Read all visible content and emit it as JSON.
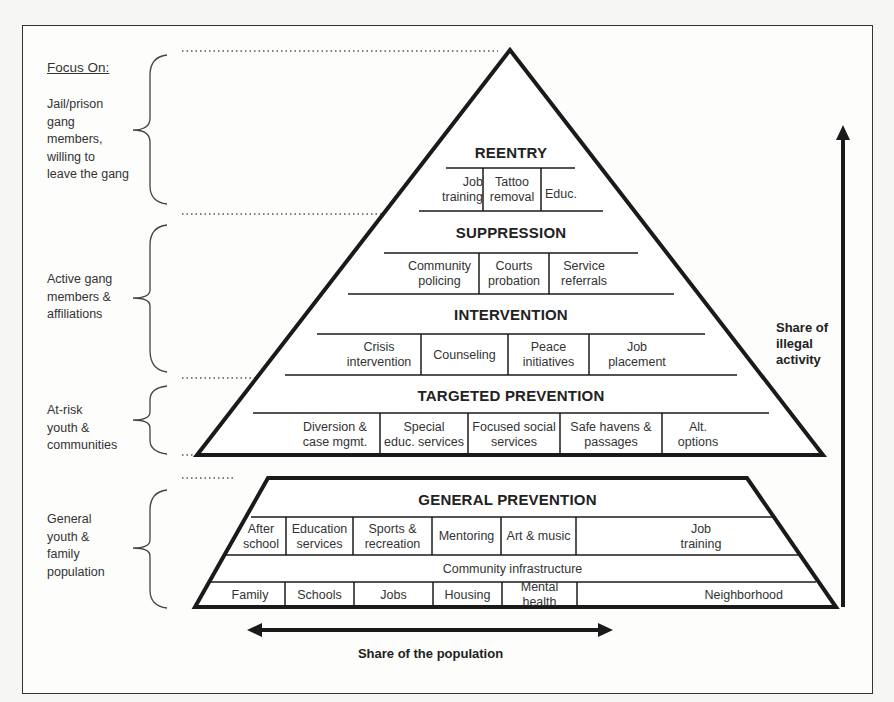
{
  "legend": {
    "heading": "Focus On:",
    "groups": [
      {
        "label_lines": [
          "Jail/prison",
          "gang",
          "members,",
          "willing to",
          "leave the gang"
        ]
      },
      {
        "label_lines": [
          "Active gang",
          "members &",
          "affiliations"
        ]
      },
      {
        "label_lines": [
          "At-risk",
          "youth &",
          "communities"
        ]
      },
      {
        "label_lines": [
          "General",
          "youth &",
          "family",
          "population"
        ]
      }
    ]
  },
  "pyramid": {
    "tiers": [
      {
        "title": "REENTRY",
        "items": [
          [
            "Job",
            "training"
          ],
          [
            "Tattoo",
            "removal"
          ],
          [
            "Educ."
          ]
        ]
      },
      {
        "title": "SUPPRESSION",
        "items": [
          [
            "Community",
            "policing"
          ],
          [
            "Courts",
            "probation"
          ],
          [
            "Service",
            "referrals"
          ]
        ]
      },
      {
        "title": "INTERVENTION",
        "items": [
          [
            "Crisis",
            "intervention"
          ],
          [
            "Counseling"
          ],
          [
            "Peace",
            "initiatives"
          ],
          [
            "Job",
            "placement"
          ]
        ]
      },
      {
        "title": "TARGETED PREVENTION",
        "items": [
          [
            "Diversion &",
            "case mgmt."
          ],
          [
            "Special",
            "educ. services"
          ],
          [
            "Focused social",
            "services"
          ],
          [
            "Safe havens &",
            "passages"
          ],
          [
            "Alt.",
            "options"
          ]
        ]
      }
    ]
  },
  "base": {
    "title": "GENERAL PREVENTION",
    "programs": [
      [
        "After",
        "school"
      ],
      [
        "Education",
        "services"
      ],
      [
        "Sports &",
        "recreation"
      ],
      [
        "Mentoring"
      ],
      [
        "Art & music"
      ],
      [
        "Job",
        "training"
      ]
    ],
    "infrastructure_label": "Community infrastructure",
    "infrastructure": [
      "Family",
      "Schools",
      "Jobs",
      "Housing",
      "Mental health",
      "Neighborhood"
    ]
  },
  "axes": {
    "vertical_label_lines": [
      "Share of",
      "illegal",
      "activity"
    ],
    "horizontal_label": "Share of the population"
  },
  "colors": {
    "line": "#1a1a1a",
    "text": "#333333",
    "dots": "#555555"
  }
}
